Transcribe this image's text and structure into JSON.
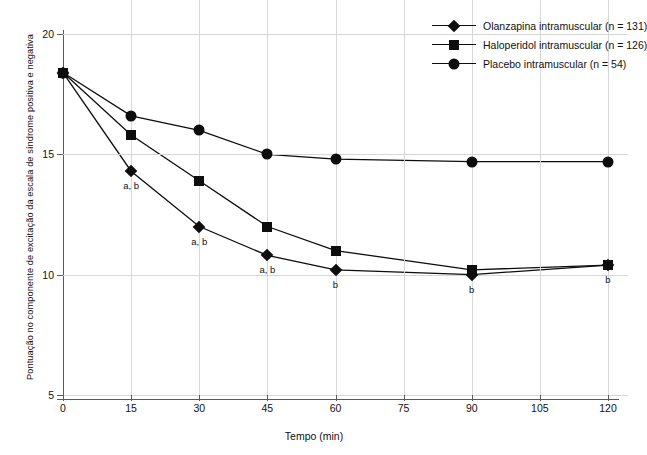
{
  "chart_data": {
    "type": "line",
    "title": "",
    "xlabel": "Tempo (min)",
    "ylabel": "Pontuação no componente de excitação da escala de síndrome positiva e negativa",
    "x": [
      0,
      15,
      30,
      45,
      60,
      90,
      120
    ],
    "xlim": [
      0,
      120
    ],
    "ylim": [
      4.2,
      20.6
    ],
    "xticks": [
      "0",
      "15",
      "30",
      "45",
      "60",
      "75",
      "90",
      "105",
      "120"
    ],
    "yticks": [
      "5",
      "10",
      "15",
      "20"
    ],
    "grid": true,
    "legend_position": "top-right",
    "series": [
      {
        "name": "Olanzapina intramuscular (n = 131)",
        "marker": "diamond",
        "color": "#0d0d0d",
        "values": [
          18.4,
          14.3,
          12.0,
          10.8,
          10.2,
          10.0,
          10.4
        ],
        "annotations": [
          "",
          "a, b",
          "a, b",
          "a, b",
          "b",
          "b",
          "b"
        ]
      },
      {
        "name": "Haloperidol intramuscular (n = 126)",
        "marker": "square",
        "color": "#0d0d0d",
        "values": [
          18.4,
          15.8,
          13.9,
          12.0,
          11.0,
          10.2,
          10.4
        ],
        "annotations": [
          "",
          "",
          "",
          "",
          "",
          "",
          ""
        ]
      },
      {
        "name": "Placebo intramuscular (n = 54)",
        "marker": "circle",
        "color": "#0d0d0d",
        "values": [
          18.4,
          16.6,
          16.0,
          15.0,
          14.8,
          14.7,
          14.7
        ],
        "annotations": [
          "",
          "",
          "",
          "",
          "",
          "",
          ""
        ]
      }
    ]
  }
}
